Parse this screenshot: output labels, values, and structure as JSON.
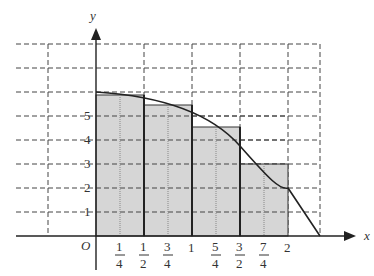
{
  "diagram": {
    "type": "riemann-sum-upper-rectangles",
    "axes": {
      "x_label": "x",
      "y_label": "y",
      "origin_label": "O"
    },
    "y_ticks": [
      "1",
      "2",
      "3",
      "4",
      "5"
    ],
    "x_ticks": [
      {
        "num": "1",
        "den": "4"
      },
      {
        "num": "1",
        "den": "2"
      },
      {
        "num": "3",
        "den": "4"
      },
      {
        "whole": "1"
      },
      {
        "num": "5",
        "den": "4"
      },
      {
        "num": "3",
        "den": "2"
      },
      {
        "num": "7",
        "den": "4"
      },
      {
        "whole": "2"
      }
    ],
    "rectangles": [
      {
        "x_from": 0,
        "x_to": 0.5,
        "height": 5.9
      },
      {
        "x_from": 0.5,
        "x_to": 1,
        "height": 5.5
      },
      {
        "x_from": 1,
        "x_to": 1.5,
        "height": 4.5
      },
      {
        "x_from": 1.5,
        "x_to": 2,
        "height": 3
      }
    ],
    "curve": {
      "description": "decreasing concave curve from (0,6) through (2,2) to x-axis near x≈2.33"
    },
    "colors": {
      "fill": "#d6d6d6",
      "stroke": "#222222",
      "grid": "#444444"
    }
  }
}
